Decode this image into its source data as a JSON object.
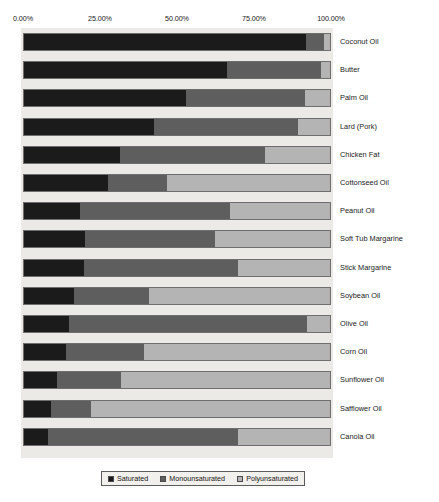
{
  "chart_data": {
    "type": "bar",
    "orientation": "horizontal",
    "stacked": true,
    "stack_mode": "percent",
    "title": "",
    "xlabel": "",
    "ylabel": "",
    "xlim": [
      0,
      100
    ],
    "grid": false,
    "legend_position": "bottom",
    "axis_ticks": [
      "0.00%",
      "25.00%",
      "50.00%",
      "75.00%",
      "100.00%"
    ],
    "axis_tick_values": [
      0,
      25,
      50,
      75,
      100
    ],
    "legend": [
      "Saturated",
      "Monounsaturated",
      "Polyunsaturated"
    ],
    "categories": [
      "Coconut Oil",
      "Butter",
      "Palm Oil",
      "Lard (Pork)",
      "Chicken Fat",
      "Cottonseed Oil",
      "Peanut Oil",
      "Soft Tub Margarine",
      "Stick Margarine",
      "Soybean Oil",
      "Olive Oil",
      "Corn Oil",
      "Sunflower Oil",
      "Safflower Oil",
      "Canola Oil"
    ],
    "series": [
      {
        "name": "Saturated",
        "color": "#1b1b1b",
        "values": [
          92.0,
          66.5,
          52.9,
          42.5,
          31.5,
          27.3,
          18.2,
          20.0,
          19.7,
          16.5,
          14.6,
          13.6,
          10.7,
          8.8,
          7.8
        ]
      },
      {
        "name": "Monounsaturated",
        "color": "#5e5e5e",
        "values": [
          6.0,
          30.5,
          39.0,
          47.1,
          47.1,
          19.5,
          49.1,
          42.3,
          50.1,
          24.5,
          77.9,
          25.7,
          21.1,
          13.2,
          62.2
        ]
      },
      {
        "name": "Polyunsaturated",
        "color": "#b4b4b4",
        "values": [
          2.0,
          3.0,
          8.1,
          10.4,
          21.4,
          53.2,
          32.7,
          37.7,
          30.2,
          59.0,
          7.5,
          60.7,
          68.2,
          78.0,
          30.0
        ]
      }
    ]
  },
  "colors": {
    "saturated": "#1b1b1b",
    "monounsaturated": "#5e5e5e",
    "polyunsaturated": "#b4b4b4",
    "plot_background": "#eceae6",
    "bar_border": "#6e6e6e",
    "page_background": "#ffffff",
    "text": "#1a1a1a"
  }
}
